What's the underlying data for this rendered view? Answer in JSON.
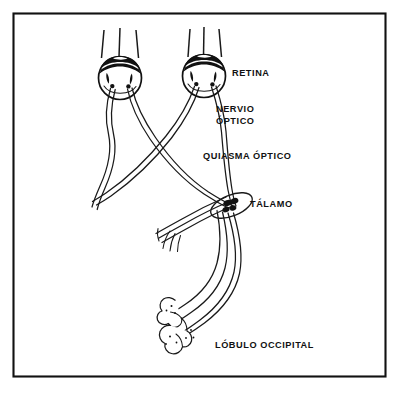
{
  "figure": {
    "language": "es",
    "background_color": "#ffffff",
    "ink_color": "#111111",
    "frame": {
      "present": true,
      "color": "#111111",
      "x": 13,
      "y": 13,
      "width": 373,
      "height": 364
    },
    "labels": [
      {
        "id": "retina",
        "text": "RETINA",
        "lines": [
          "RETINA"
        ],
        "x": 232,
        "y": 75
      },
      {
        "id": "nervio-optico",
        "text": "NERVIO ÓPTICO",
        "lines": [
          "NERVIO",
          "ÓPTICO"
        ],
        "x": 216,
        "y": 113
      },
      {
        "id": "quiasma-optico",
        "text": "QUIASMA ÓPTICO",
        "lines": [
          "QUIASMA ÓPTICO"
        ],
        "x": 203,
        "y": 158
      },
      {
        "id": "talamo",
        "text": "TÁLAMO",
        "lines": [
          "TÁLAMO"
        ],
        "x": 250,
        "y": 205
      },
      {
        "id": "lobulo-occipital",
        "text": "LÓBULO OCCIPITAL",
        "lines": [
          "LÓBULO OCCIPITAL"
        ],
        "x": 215,
        "y": 345
      }
    ],
    "structures": [
      {
        "id": "left-eye",
        "name": "ojo izquierdo",
        "cx": 120,
        "cy": 78,
        "r": 22
      },
      {
        "id": "right-eye",
        "name": "ojo derecho",
        "cx": 204,
        "cy": 76,
        "r": 22
      },
      {
        "id": "optic-chiasm",
        "name": "quiasma óptico",
        "cx": 158,
        "cy": 148
      },
      {
        "id": "thalamus",
        "name": "tálamo",
        "cx": 230,
        "cy": 205
      },
      {
        "id": "occipital-lobe",
        "name": "lóbulo occipital",
        "cx": 185,
        "cy": 330
      }
    ],
    "light_rays": {
      "count_per_eye": 3,
      "eyes": 2
    }
  }
}
